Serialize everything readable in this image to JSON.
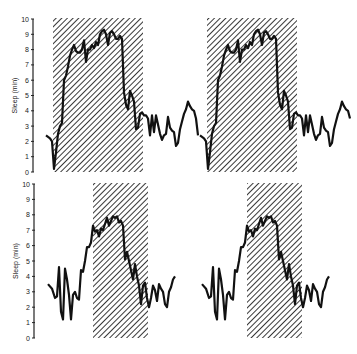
{
  "chart_data": [
    {
      "type": "line",
      "title": "",
      "xlabel": "",
      "ylabel": "Sleep (min)",
      "ylim": [
        0,
        10
      ],
      "yticks": [
        0,
        1,
        2,
        3,
        4,
        5,
        6,
        7,
        8,
        9,
        10
      ],
      "grid": false,
      "double_plotted": true,
      "shaded_regions": [
        {
          "x_start": 53,
          "x_end": 143
        },
        {
          "x_start": 207,
          "x_end": 297
        }
      ],
      "series": [
        {
          "name": "sleep",
          "x": [
            46,
            50,
            52,
            54,
            56,
            58,
            60,
            62,
            64,
            66,
            68,
            70,
            72,
            74,
            76,
            78,
            80,
            82,
            84,
            86,
            88,
            90,
            92,
            94,
            96,
            98,
            100,
            102,
            104,
            106,
            108,
            110,
            112,
            114,
            116,
            118,
            120,
            122,
            124,
            126,
            128,
            130,
            132,
            134,
            136,
            138,
            140,
            142,
            144,
            146,
            148,
            150,
            152,
            154,
            156,
            158,
            160,
            162,
            164,
            166,
            168,
            170,
            172,
            174,
            176,
            178,
            180,
            182,
            184,
            186,
            188,
            190,
            192,
            194,
            196,
            198
          ],
          "values": [
            2.4,
            2.2,
            2.0,
            0.2,
            1.3,
            2.5,
            3.0,
            3.2,
            6.0,
            6.3,
            6.9,
            7.6,
            8.0,
            8.3,
            7.9,
            7.8,
            7.8,
            8.0,
            8.6,
            7.2,
            8.0,
            8.0,
            8.3,
            8.1,
            8.5,
            8.3,
            9.0,
            9.2,
            9.3,
            9.0,
            8.3,
            9.1,
            9.2,
            9.0,
            8.7,
            8.7,
            8.9,
            8.7,
            5.2,
            4.4,
            4.1,
            5.3,
            5.0,
            4.6,
            2.8,
            2.9,
            3.8,
            3.9,
            3.7,
            3.7,
            3.5,
            2.4,
            3.7,
            2.6,
            3.7,
            3.1,
            2.5,
            2.1,
            2.4,
            2.5,
            3.6,
            2.9,
            2.7,
            2.6,
            1.7,
            1.9,
            2.8,
            3.3,
            3.8,
            4.1,
            4.6,
            4.3,
            4.1,
            4.0,
            3.5,
            2.4
          ]
        }
      ]
    },
    {
      "type": "line",
      "title": "",
      "xlabel": "",
      "ylabel": "Sleep (min)",
      "ylim": [
        0,
        10
      ],
      "yticks": [
        0,
        1,
        2,
        3,
        4,
        5,
        6,
        7,
        8,
        9,
        10
      ],
      "grid": false,
      "double_plotted": true,
      "shaded_regions": [
        {
          "x_start": 93,
          "x_end": 148
        },
        {
          "x_start": 247,
          "x_end": 302
        }
      ],
      "series": [
        {
          "name": "sleep",
          "x": [
            48,
            52,
            55,
            57,
            59,
            61,
            63,
            65,
            67,
            69,
            71,
            73,
            75,
            77,
            79,
            81,
            83,
            85,
            87,
            89,
            91,
            93,
            95,
            97,
            99,
            101,
            103,
            105,
            107,
            109,
            111,
            113,
            115,
            117,
            119,
            121,
            123,
            125,
            127,
            129,
            131,
            133,
            135,
            137,
            139,
            141,
            143,
            145,
            147,
            149,
            151,
            153,
            155,
            157,
            159,
            161,
            163,
            165,
            167,
            169,
            171,
            173,
            175
          ],
          "values": [
            3.5,
            3.2,
            2.6,
            2.7,
            4.6,
            1.7,
            1.2,
            4.5,
            3.8,
            2.8,
            1.2,
            2.8,
            3.0,
            2.6,
            2.5,
            4.4,
            4.3,
            5.0,
            5.9,
            5.9,
            6.2,
            7.3,
            6.9,
            7.0,
            6.6,
            7.1,
            7.0,
            7.4,
            7.8,
            7.3,
            7.6,
            7.9,
            7.8,
            7.9,
            7.5,
            7.6,
            7.3,
            5.1,
            5.6,
            5.0,
            4.4,
            3.8,
            4.8,
            4.0,
            3.4,
            2.2,
            3.4,
            3.6,
            2.6,
            2.0,
            2.6,
            3.4,
            3.1,
            2.4,
            3.5,
            3.2,
            3.0,
            2.2,
            2.0,
            3.0,
            3.3,
            3.8,
            4.0
          ]
        }
      ]
    }
  ],
  "axes": {
    "ylabel": "Sleep (min)",
    "ticks": [
      "0",
      "1",
      "2",
      "3",
      "4",
      "5",
      "6",
      "7",
      "8",
      "9",
      "10"
    ]
  }
}
